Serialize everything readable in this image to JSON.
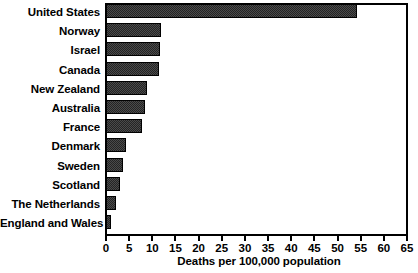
{
  "chart_data": {
    "type": "bar",
    "orientation": "horizontal",
    "title": "",
    "xlabel": "Deaths per 100,000 population",
    "ylabel": "",
    "xlim": [
      0,
      65
    ],
    "xticks": [
      0,
      5,
      10,
      15,
      20,
      25,
      30,
      35,
      40,
      45,
      50,
      55,
      60,
      65
    ],
    "grid": false,
    "legend": null,
    "categories": [
      "United States",
      "Norway",
      "Israel",
      "Canada",
      "New Zealand",
      "Australia",
      "France",
      "Denmark",
      "Sweden",
      "Scotland",
      "The Netherlands",
      "England and Wales"
    ],
    "values": [
      54.2,
      11.9,
      11.6,
      11.4,
      8.8,
      8.4,
      7.7,
      4.3,
      3.7,
      3.0,
      2.1,
      1.1
    ],
    "bar_color": "#242424"
  },
  "axis": {
    "tick_labels": [
      "0",
      "5",
      "10",
      "15",
      "20",
      "25",
      "30",
      "35",
      "40",
      "45",
      "50",
      "55",
      "60",
      "65"
    ],
    "x_axis_title": "Deaths per 100,000 population"
  }
}
